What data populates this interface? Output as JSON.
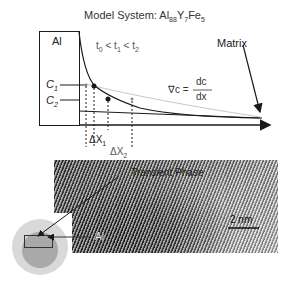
{
  "title": {
    "prefix": "Model System: Al",
    "al_sub": "88",
    "y": "Y",
    "y_sub": "7",
    "fe": "Fe",
    "fe_sub": "5"
  },
  "diagram": {
    "al_box_label": "Al",
    "time_relation": {
      "t0": "t",
      "t0_sub": "0",
      "lt1": " < t",
      "t1_sub": "1",
      "lt2": " < t",
      "t2_sub": "2"
    },
    "matrix_label": "Matrix",
    "c1_label": "C",
    "c1_sub": "1",
    "c2_label": "C",
    "c2_sub": "2",
    "gradient_lhs": "∇c =",
    "gradient_num": "dc",
    "gradient_den": "dx",
    "dx1_label": "ΔX",
    "dx1_sub": "1",
    "dx2_label": "ΔX",
    "dx2_sub": "2"
  },
  "micrograph": {
    "transient_phase_label": "Transient Phase",
    "al_label": "Al",
    "scale_bar_label": "2 nm"
  },
  "colors": {
    "line": "#1a1a1a",
    "light_curve": "#c8c8c8",
    "particle_outer": "#d9d9d9",
    "particle_inner": "#a9a9a9"
  }
}
